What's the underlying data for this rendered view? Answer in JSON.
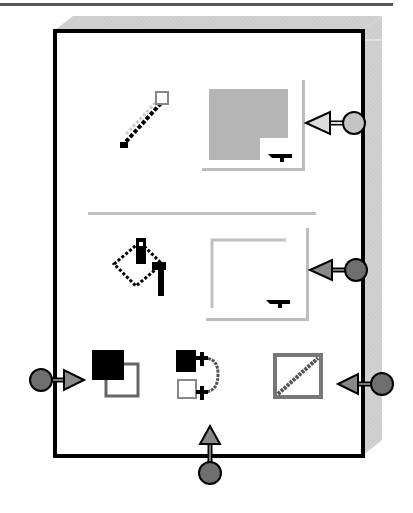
{
  "diagram": {
    "colors": {
      "panel_border": "#000000",
      "bevel": "#cfcfcf",
      "stroke_swatch": "#b5b5b5",
      "fill_swatch": "#ffffff",
      "callout_light": "#c4c4c4",
      "callout_dark": "#6e6e6e"
    },
    "rows": [
      {
        "id": "stroke",
        "icon": "pencil-icon",
        "swatch": "stroke-color-swatch",
        "dropdown": "chevron-down-icon"
      },
      {
        "id": "fill",
        "icon": "paint-bucket-icon",
        "swatch": "fill-color-swatch",
        "dropdown": "chevron-down-icon"
      }
    ],
    "buttons": [
      {
        "id": "default-colors",
        "icon": "default-colors-icon"
      },
      {
        "id": "swap-colors",
        "icon": "swap-colors-icon"
      },
      {
        "id": "no-color",
        "icon": "no-color-icon"
      }
    ],
    "callouts": [
      {
        "target": "stroke-color-swatch",
        "side": "right",
        "shade": "light"
      },
      {
        "target": "fill-color-swatch",
        "side": "right",
        "shade": "dark"
      },
      {
        "target": "default-colors",
        "side": "left",
        "shade": "dark"
      },
      {
        "target": "swap-colors",
        "side": "bottom",
        "shade": "dark"
      },
      {
        "target": "no-color",
        "side": "right",
        "shade": "dark"
      }
    ]
  }
}
